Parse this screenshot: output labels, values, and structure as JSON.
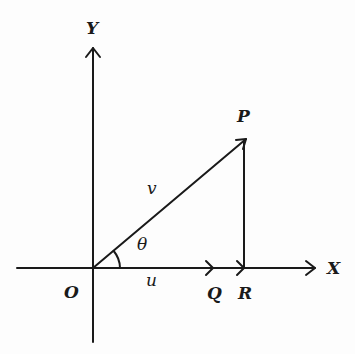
{
  "diagram": {
    "type": "vector-resolution",
    "axes": {
      "x_label": "X",
      "y_label": "Y",
      "origin_label": "O"
    },
    "points": {
      "P": "P",
      "Q": "Q",
      "R": "R"
    },
    "vectors": {
      "v_label": "v",
      "u_label": "u"
    },
    "angle_label": "θ",
    "colors": {
      "ink": "#1a1a1a",
      "background": "#fdfdfd"
    }
  }
}
